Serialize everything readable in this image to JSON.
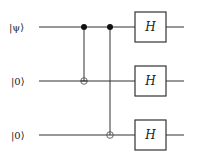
{
  "diagram": {
    "type": "quantum-circuit",
    "qubits": [
      {
        "label": "|ψ⟩",
        "y": 27
      },
      {
        "label": "|0⟩",
        "y": 81
      },
      {
        "label": "|0⟩",
        "y": 135
      }
    ],
    "wire": {
      "x_start": 39,
      "x_end": 184
    },
    "gates": [
      {
        "type": "CNOT",
        "control_qubit": 0,
        "target_qubit": 1,
        "x": 84
      },
      {
        "type": "CNOT",
        "control_qubit": 0,
        "target_qubit": 2,
        "x": 110
      },
      {
        "type": "H",
        "qubit": 0,
        "label": "H",
        "x": 135,
        "width": 31,
        "height": 30
      },
      {
        "type": "H",
        "qubit": 1,
        "label": "H",
        "x": 135,
        "width": 31,
        "height": 30
      },
      {
        "type": "H",
        "qubit": 2,
        "label": "H",
        "x": 135,
        "width": 31,
        "height": 30
      }
    ],
    "colors": {
      "line": "#333333",
      "control": "#111111",
      "background": "#ffffff"
    }
  }
}
